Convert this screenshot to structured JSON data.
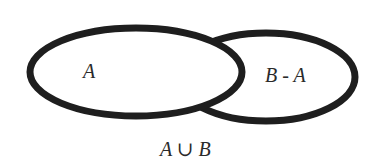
{
  "diagram": {
    "type": "venn",
    "title": "",
    "sets": [
      {
        "name": "A",
        "label": "A"
      },
      {
        "name": "B",
        "label": "B"
      }
    ],
    "region_labels": {
      "a": "A",
      "b_minus_a": "B - A"
    },
    "caption": "A ∪ B",
    "colors": {
      "stroke": "#1e1e1e",
      "background": "#ffffff",
      "text": "#2a2a2a"
    }
  }
}
